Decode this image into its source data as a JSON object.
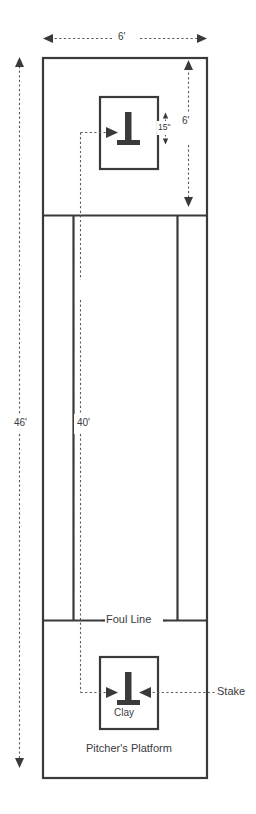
{
  "diagram": {
    "type": "technical-dimension-diagram",
    "colors": {
      "line": "#3a3a3c",
      "dimension_line": "#5a5a5e",
      "background": "#ffffff"
    },
    "dimensions": [
      {
        "id": "court-width",
        "label": "6'",
        "orientation": "horizontal",
        "position": "top",
        "arrows": "both"
      },
      {
        "id": "pit-depth",
        "label": "6'",
        "orientation": "vertical",
        "position": "right-of-upper-box",
        "arrows": "both"
      },
      {
        "id": "stake-height",
        "label": "15\"",
        "orientation": "vertical",
        "position": "right-of-upper-stake",
        "arrows": "both"
      },
      {
        "id": "stake-to-stake",
        "label": "40'",
        "orientation": "vertical",
        "position": "center-left",
        "arrows": "both"
      },
      {
        "id": "overall-length",
        "label": "46'",
        "orientation": "vertical",
        "position": "far-left",
        "arrows": "both"
      }
    ],
    "labels": [
      {
        "id": "foul-line",
        "text": "Foul Line"
      },
      {
        "id": "clay",
        "text": "Clay"
      },
      {
        "id": "pitchers-platform",
        "text": "Pitcher's Platform"
      },
      {
        "id": "stake",
        "text": "Stake"
      }
    ],
    "features": {
      "upper_pit_box": "clay pit with stake",
      "lower_pit_box": "clay pit with stake",
      "stake_icon": "stake-icon",
      "walkway_lines": 2
    }
  }
}
